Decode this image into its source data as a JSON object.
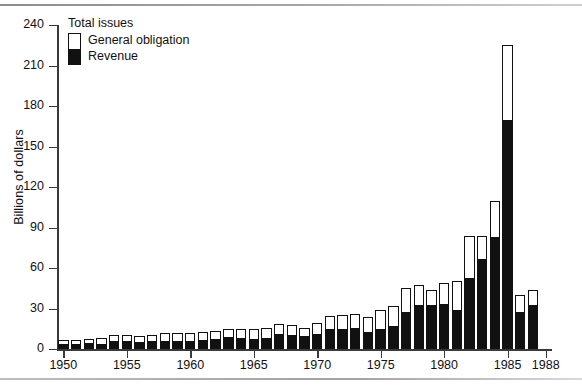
{
  "chart_data": {
    "type": "bar",
    "title": "",
    "subtitle": "",
    "xlabel": "",
    "ylabel": "Billions of dollars",
    "ylim": [
      0,
      240
    ],
    "yticks": [
      0,
      30,
      60,
      90,
      120,
      150,
      180,
      210,
      240
    ],
    "xticks": [
      1950,
      1955,
      1960,
      1965,
      1970,
      1975,
      1980,
      1985,
      1988
    ],
    "xlim": [
      1949.5,
      1988.5
    ],
    "grid": false,
    "stacked": true,
    "legend_title": "Total issues",
    "legend_position": "top-left",
    "legend": [
      "General obligation",
      "Revenue"
    ],
    "colors": {
      "general_obligation": "#ffffff",
      "revenue": "#111111",
      "axis": "#3a3a3a",
      "outline": "#111111"
    },
    "categories": [
      1950,
      1951,
      1952,
      1953,
      1954,
      1955,
      1956,
      1957,
      1958,
      1959,
      1960,
      1961,
      1962,
      1963,
      1964,
      1965,
      1966,
      1967,
      1968,
      1969,
      1970,
      1971,
      1972,
      1973,
      1974,
      1975,
      1976,
      1977,
      1978,
      1979,
      1980,
      1981,
      1982,
      1983,
      1984,
      1985,
      1986,
      1987
    ],
    "series": [
      {
        "name": "Revenue",
        "values": [
          4.0,
          4.0,
          4.5,
          4.0,
          6.0,
          6.0,
          5.5,
          6.0,
          6.5,
          6.5,
          6.5,
          7.0,
          8.0,
          9.0,
          8.5,
          8.0,
          8.5,
          11.0,
          10.5,
          9.5,
          11.5,
          15.0,
          15.0,
          16.0,
          13.0,
          15.0,
          17.5,
          28.0,
          33.0,
          33.0,
          33.5,
          29.0,
          53.0,
          67.0,
          83.5,
          170.0,
          28.0,
          33.0
        ]
      },
      {
        "name": "General obligation",
        "values": [
          3.0,
          3.0,
          3.0,
          4.5,
          4.5,
          4.5,
          4.5,
          4.5,
          5.5,
          5.5,
          5.5,
          5.5,
          5.5,
          6.0,
          6.0,
          6.5,
          7.0,
          7.5,
          7.5,
          6.0,
          7.5,
          9.5,
          10.5,
          10.0,
          11.0,
          14.0,
          14.5,
          17.0,
          14.5,
          11.0,
          15.5,
          21.5,
          30.5,
          16.5,
          26.5,
          55.0,
          12.0,
          11.0
        ]
      }
    ],
    "totals": [
      7.0,
      7.0,
      7.5,
      8.5,
      10.5,
      10.5,
      10.0,
      10.5,
      12.0,
      12.0,
      12.0,
      12.5,
      13.5,
      15.0,
      14.5,
      14.5,
      15.5,
      18.5,
      18.0,
      15.5,
      19.0,
      24.5,
      25.5,
      26.0,
      24.0,
      29.0,
      32.0,
      45.0,
      47.5,
      44.0,
      49.0,
      50.5,
      83.5,
      83.5,
      110.0,
      225.0,
      40.0,
      44.0
    ]
  }
}
